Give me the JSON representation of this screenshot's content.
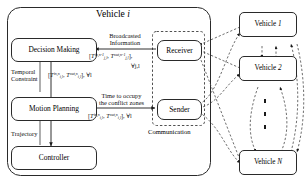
{
  "diagram": {
    "title_prefix": "Vehicle ",
    "title_index": "i",
    "ego_blocks": [
      {
        "id": "decision-making",
        "label": "Decision Making"
      },
      {
        "id": "motion-planning",
        "label": "Motion Planning"
      },
      {
        "id": "controller",
        "label": "Controller"
      },
      {
        "id": "receiver",
        "label": "Receiver"
      },
      {
        "id": "sender",
        "label": "Sender"
      }
    ],
    "edge_labels": {
      "broadcasted_line1": "Broadcasted",
      "broadcasted_line2": "Information",
      "temporal_line1": "Temporal",
      "temporal_line2": "Constraint",
      "occupy_line1": "Time to occupy",
      "occupy_line2": "the conflict zones",
      "trajectory": "Trajectory"
    },
    "communication_label": "Communication",
    "formulas": {
      "broadcasted": {
        "text": "[T_{j,l}^{in,n-1} , T_{j,l}^{out,n-1}], ∀j,l",
        "open": "[",
        "t1_base": "T",
        "t1_sub": "j,l",
        "t1_sup": "in,n-1",
        "sep": ", ",
        "t2_base": "T",
        "t2_sub": "j,l",
        "t2_sup": "out,n-1",
        "close": "],",
        "quant": "∀j,l"
      },
      "temporal": {
        "text": "[T_{i,l}^{in,n} , T_{i,l}^{out,n}], ∀l",
        "open": "[",
        "t1_base": "T",
        "t1_sub": "i,l",
        "t1_sup": "in,n",
        "sep": ", ",
        "t2_base": "T",
        "t2_sub": "i,l",
        "t2_sup": "out,n",
        "close": "],",
        "quant": "∀l"
      },
      "occupy": {
        "text": "[T_{i,l}^{in,n} , T_{i,l}^{out,n}], ∀l",
        "open": "[",
        "t1_base": "T",
        "t1_sub": "i,l",
        "t1_sup": "in,n",
        "sep": ", ",
        "t2_base": "T",
        "t2_sub": "i,l",
        "t2_sup": "out,n",
        "close": "],",
        "quant": "∀l"
      }
    },
    "other_vehicles": [
      {
        "id": "vehicle-1",
        "prefix": "Vehicle ",
        "index": "1"
      },
      {
        "id": "vehicle-2",
        "prefix": "Vehicle ",
        "index": "2"
      },
      {
        "id": "vehicle-n",
        "prefix": "Vehicle ",
        "index": "N"
      }
    ],
    "vertical_ellipsis": "⋮",
    "colors": {
      "stroke": "#2a2a2a",
      "dashed_stroke": "#555555",
      "text": "#000000",
      "background": "#ffffff"
    }
  }
}
